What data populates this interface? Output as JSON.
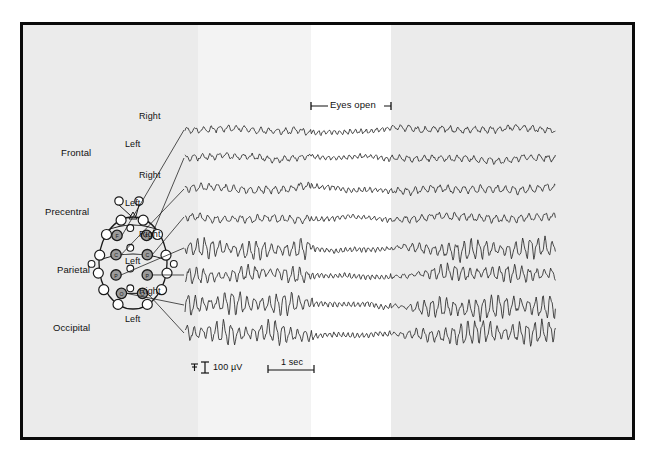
{
  "figure": {
    "type": "eeg-recording-chart",
    "border_color": "#0a0a0a",
    "background_bands": [
      {
        "name": "band-left-gray",
        "x": 0,
        "width": 175,
        "color": "#ebebeb"
      },
      {
        "name": "band-mid-light",
        "x": 175,
        "width": 113,
        "color": "#f3f3f3"
      },
      {
        "name": "band-white",
        "x": 288,
        "width": 80,
        "color": "#ffffff"
      },
      {
        "name": "band-right-gray",
        "x": 368,
        "width": 241,
        "color": "#ebebeb"
      }
    ]
  },
  "head_diagram": {
    "name": "electrode-placement-head-map",
    "outline_color": "#1a1a1a",
    "electrode_open_color": "#ffffff",
    "electrode_active_color": "#9a9a9a",
    "active_electrode_labels": [
      "F",
      "F",
      "C",
      "C",
      "P",
      "P",
      "O",
      "O"
    ]
  },
  "annotations": {
    "eyes_open_label": "Eyes open"
  },
  "scale_bar": {
    "amplitude_label": "100 µV",
    "time_label": "1 sec"
  },
  "channels": [
    {
      "region": "Frontal",
      "side": "Right",
      "row": 0
    },
    {
      "region": "Frontal",
      "side": "Left",
      "row": 1
    },
    {
      "region": "Precentral",
      "side": "Right",
      "row": 2
    },
    {
      "region": "Precentral",
      "side": "Left",
      "row": 3
    },
    {
      "region": "Parietal",
      "side": "Right",
      "row": 4
    },
    {
      "region": "Parietal",
      "side": "Left",
      "row": 5
    },
    {
      "region": "Occipital",
      "side": "Right",
      "row": 6
    },
    {
      "region": "Occipital",
      "side": "Left",
      "row": 7
    }
  ],
  "chart_data": {
    "type": "line",
    "title": "",
    "xlabel": "",
    "ylabel": "",
    "x_units": "seconds",
    "y_units": "microvolts",
    "time_scale_bar_seconds": 1,
    "amplitude_scale_bar_uv": 100,
    "trace_x_start_px": 162,
    "trace_x_end_px": 533,
    "epochs": [
      {
        "name": "eyes-closed-pre",
        "x_start_px": 162,
        "x_end_px": 288,
        "state": "eyes closed"
      },
      {
        "name": "eyes-open",
        "x_start_px": 288,
        "x_end_px": 368,
        "state": "eyes open"
      },
      {
        "name": "eyes-closed-post",
        "x_start_px": 368,
        "x_end_px": 533,
        "state": "eyes closed"
      }
    ],
    "series": [
      {
        "name": "Frontal Right",
        "baseline_y_px": 105,
        "amp_closed_uv": 22,
        "amp_open_uv": 16,
        "freq_closed_hz": 9,
        "freq_open_hz": 14,
        "alpha_rhythm": false
      },
      {
        "name": "Frontal Left",
        "baseline_y_px": 133,
        "amp_closed_uv": 22,
        "amp_open_uv": 16,
        "freq_closed_hz": 9,
        "freq_open_hz": 14,
        "alpha_rhythm": false
      },
      {
        "name": "Precentral Right",
        "baseline_y_px": 164,
        "amp_closed_uv": 26,
        "amp_open_uv": 17,
        "freq_closed_hz": 9,
        "freq_open_hz": 14,
        "alpha_rhythm": false
      },
      {
        "name": "Precentral Left",
        "baseline_y_px": 192,
        "amp_closed_uv": 26,
        "amp_open_uv": 17,
        "freq_closed_hz": 9,
        "freq_open_hz": 14,
        "alpha_rhythm": false
      },
      {
        "name": "Parietal Right",
        "baseline_y_px": 223,
        "amp_closed_uv": 75,
        "amp_open_uv": 18,
        "freq_closed_hz": 10,
        "freq_open_hz": 16,
        "alpha_rhythm": true
      },
      {
        "name": "Parietal Left",
        "baseline_y_px": 250,
        "amp_closed_uv": 62,
        "amp_open_uv": 18,
        "freq_closed_hz": 10,
        "freq_open_hz": 16,
        "alpha_rhythm": true
      },
      {
        "name": "Occipital Right",
        "baseline_y_px": 280,
        "amp_closed_uv": 88,
        "amp_open_uv": 18,
        "freq_closed_hz": 10,
        "freq_open_hz": 16,
        "alpha_rhythm": true
      },
      {
        "name": "Occipital Left",
        "baseline_y_px": 308,
        "amp_closed_uv": 88,
        "amp_open_uv": 18,
        "freq_closed_hz": 10,
        "freq_open_hz": 16,
        "alpha_rhythm": true
      }
    ],
    "legend_position": "none",
    "grid": false,
    "observation": "Alpha rhythm is prominent over parietal and occipital leads with eyes closed and is blocked (attenuated) while the eyes are open."
  }
}
